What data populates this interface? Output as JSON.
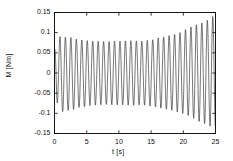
{
  "chart_data": {
    "type": "line",
    "title": "",
    "subtitle": "",
    "xlabel": "t [s]",
    "ylabel": "M [Nm]",
    "xlim": [
      0,
      25
    ],
    "ylim": [
      -0.15,
      0.15
    ],
    "xticks": [
      0,
      5,
      10,
      15,
      20,
      25
    ],
    "xtick_labels": [
      "0",
      "5",
      "10",
      "15",
      "20",
      "25"
    ],
    "yticks": [
      0.15,
      0.1,
      0.05,
      0,
      -0.05,
      -0.1,
      -0.15
    ],
    "ytick_labels": [
      "0.15",
      "0.1",
      "0.05",
      "0",
      "-0.05",
      "-0.1",
      "-0.15"
    ],
    "grid": false,
    "legend": false,
    "legend_position": "none",
    "line_color": "#1a1a1a",
    "line_width": 0.6,
    "frame_color": "#000000",
    "background": "#ffffff",
    "oscillation_frequency_hz": 1.18,
    "envelope_upper_x": [
      0,
      1.0,
      2.5,
      4.0,
      6.0,
      8.0,
      10.0,
      12.0,
      13.5,
      15.0,
      16.5,
      18.0,
      19.5,
      20.5,
      21.5,
      22.5,
      23.5,
      24.4,
      25.0
    ],
    "envelope_upper_y": [
      0.092,
      0.09,
      0.088,
      0.082,
      0.079,
      0.078,
      0.079,
      0.08,
      0.079,
      0.082,
      0.088,
      0.093,
      0.1,
      0.108,
      0.116,
      0.122,
      0.129,
      0.14,
      0.141
    ],
    "envelope_lower_x": [
      0,
      1.0,
      2.5,
      4.0,
      6.0,
      8.0,
      10.0,
      12.0,
      13.5,
      15.0,
      16.5,
      18.0,
      19.5,
      20.5,
      21.5,
      22.5,
      23.5,
      24.4,
      25.0
    ],
    "envelope_lower_y": [
      -0.06,
      -0.096,
      -0.092,
      -0.085,
      -0.08,
      -0.078,
      -0.079,
      -0.08,
      -0.079,
      -0.082,
      -0.087,
      -0.092,
      -0.098,
      -0.104,
      -0.112,
      -0.12,
      -0.126,
      -0.133,
      -0.134
    ],
    "series": [
      {
        "name": "M(t)",
        "color": "#1a1a1a",
        "n_points": 2400
      }
    ]
  }
}
